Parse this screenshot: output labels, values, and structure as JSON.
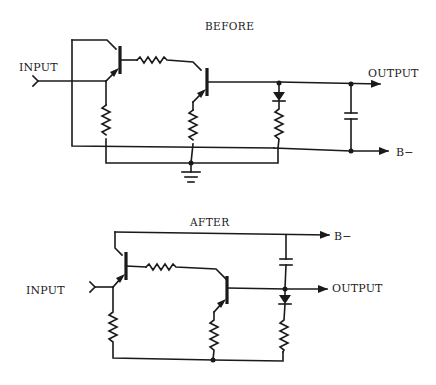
{
  "diagrams": [
    {
      "title": "BEFORE",
      "input_label": "INPUT",
      "output_label": "OUTPUT",
      "supply_label": "B−",
      "components": [
        "transistor",
        "transistor",
        "resistor",
        "resistor",
        "resistor",
        "resistor",
        "diode",
        "capacitor",
        "ground"
      ]
    },
    {
      "title": "AFTER",
      "input_label": "INPUT",
      "output_label": "OUTPUT",
      "supply_label": "B−",
      "components": [
        "transistor",
        "transistor",
        "resistor",
        "resistor",
        "resistor",
        "resistor",
        "diode",
        "capacitor"
      ]
    }
  ]
}
